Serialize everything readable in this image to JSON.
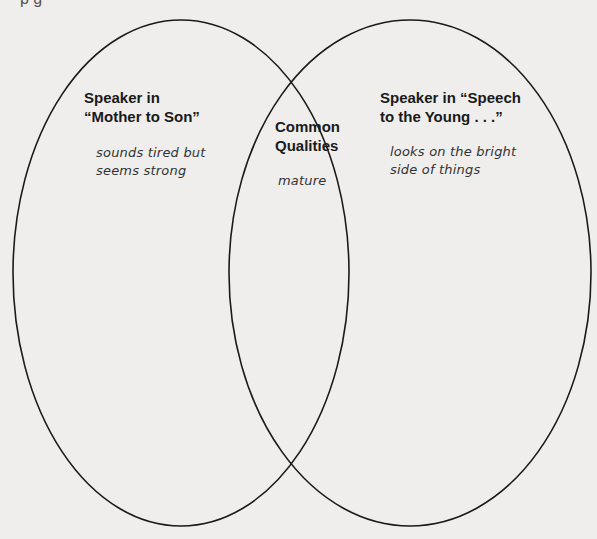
{
  "diagram": {
    "type": "venn",
    "top_fragment": "p        g",
    "left_circle": {
      "title": "Speaker in\n“Mother to Son”",
      "note": "sounds tired but\nseems strong"
    },
    "overlap": {
      "title": "Common\nQualities",
      "note": "mature"
    },
    "right_circle": {
      "title": "Speaker in “Speech\nto the Young . . .”",
      "note": "looks on the bright\nside of things"
    },
    "colors": {
      "background": "#efeeec",
      "stroke": "#1a1a1a",
      "text": "#1a1a1a"
    }
  }
}
